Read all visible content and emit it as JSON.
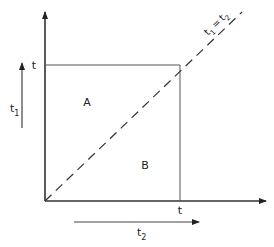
{
  "diagram": {
    "type": "integration-region",
    "axes": {
      "vertical_label": "t",
      "vertical_label_sub": "1",
      "horizontal_label": "t",
      "horizontal_label_sub": "2"
    },
    "ticks": {
      "vertical_tick": "t",
      "horizontal_tick": "t"
    },
    "regions": {
      "upper": "A",
      "lower": "B"
    },
    "diagonal_label": {
      "lhs": "t",
      "lhs_sub": "1",
      "eq": "=",
      "rhs": "t",
      "rhs_sub": "2"
    },
    "colors": {
      "line": "#333333",
      "text": "#222222",
      "background": "#ffffff"
    }
  }
}
